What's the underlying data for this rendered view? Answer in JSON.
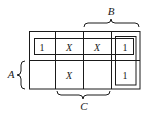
{
  "diagram": {
    "type": "karnaugh-map",
    "rows": 2,
    "cols": 4,
    "cells": [
      [
        "1",
        "X",
        "X",
        "1"
      ],
      [
        "",
        "X",
        "",
        "1"
      ]
    ],
    "labels": {
      "top": "B",
      "left": "A",
      "bottom": "C"
    },
    "groupings": [
      {
        "name": "row-0-group",
        "covers": "row 0, cols 0-3"
      },
      {
        "name": "col-3-group",
        "covers": "col 3, rows 0-1"
      }
    ],
    "colors": {
      "ink": "#1a1a1a",
      "background": "#ffffff"
    }
  }
}
